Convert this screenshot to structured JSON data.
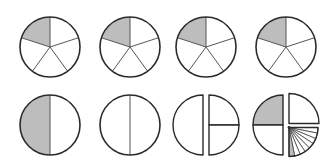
{
  "colors": {
    "shaded": "#bdbdbd",
    "unshaded": "#ffffff",
    "stroke": "#2b2b2b"
  },
  "rows": [
    {
      "name": "fifths-row",
      "figures": [
        {
          "type": "pie",
          "parts": 5,
          "shaded": [
            0
          ]
        },
        {
          "type": "pie",
          "parts": 5,
          "shaded": [
            0
          ]
        },
        {
          "type": "pie",
          "parts": 5,
          "shaded": [
            0
          ]
        },
        {
          "type": "pie",
          "parts": 5,
          "shaded": [
            0
          ]
        }
      ]
    },
    {
      "name": "halves-decomposition-row",
      "figures": [
        {
          "type": "halves",
          "shaded_left": true
        },
        {
          "type": "halves",
          "shaded_left": false
        },
        {
          "type": "split-halves",
          "right_quartered": true
        },
        {
          "type": "exploded",
          "shaded_quarter": "top-left",
          "small_fan_parts": 8,
          "small_fan_shaded": [
            0
          ]
        }
      ]
    }
  ]
}
